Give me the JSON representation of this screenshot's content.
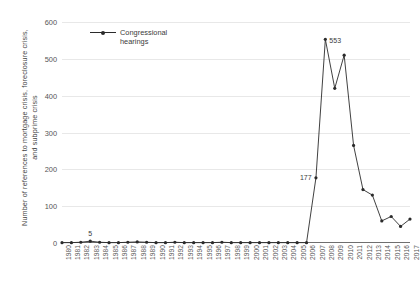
{
  "chart_data": {
    "type": "line",
    "title": "",
    "xlabel": "",
    "ylabel_line1": "Number of references to mortgage crisis, foreclosure crisis,",
    "ylabel_line2": "and subprime crisis",
    "ylim": [
      0,
      600
    ],
    "yticks": [
      0,
      100,
      200,
      300,
      400,
      500,
      600
    ],
    "grid": true,
    "legend_position": "top-left-inside",
    "categories": [
      "1980",
      "1981",
      "1982",
      "1983",
      "1984",
      "1985",
      "1986",
      "1987",
      "1988",
      "1989",
      "1990",
      "1991",
      "1992",
      "1993",
      "1994",
      "1995",
      "1996",
      "1997",
      "1998",
      "1999",
      "2000",
      "2001",
      "2002",
      "2003",
      "2004",
      "2005",
      "2006",
      "2007",
      "2008",
      "2009",
      "2010",
      "2011",
      "2012",
      "2013",
      "2014",
      "2015",
      "2016",
      "2017"
    ],
    "series": [
      {
        "name_line1": "Congressional",
        "name_line2": "hearings",
        "color": "#2b2b2b",
        "values": [
          1,
          1,
          2,
          5,
          2,
          1,
          1,
          2,
          3,
          2,
          1,
          1,
          2,
          1,
          1,
          1,
          1,
          2,
          1,
          1,
          1,
          1,
          1,
          1,
          1,
          1,
          1,
          177,
          553,
          420,
          510,
          265,
          145,
          130,
          60,
          72,
          45,
          65
        ]
      }
    ],
    "annotations": [
      {
        "label": "5",
        "category": "1983"
      },
      {
        "label": "177",
        "category": "2007"
      },
      {
        "label": "553",
        "category": "2008"
      }
    ]
  }
}
